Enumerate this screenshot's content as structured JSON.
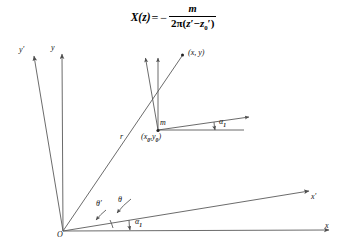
{
  "figure": {
    "equation": {
      "lhs": "X(z)",
      "equals": "=",
      "sign": "−",
      "numerator": "m",
      "denominator_prefix": "2π(",
      "denominator_z": "z",
      "denominator_prime": "′",
      "denominator_minus": "−",
      "denominator_z0": "z",
      "denominator_z0_sub": "0",
      "denominator_z0_prime": "′",
      "denominator_suffix": ")",
      "plain": "X(z) = − m / (2π(z′ − z′0))"
    },
    "labels": {
      "origin": "O",
      "axis_y_prime": "y′",
      "axis_y": "y",
      "axis_x_prime": "x′",
      "axis_x": "x",
      "point_xy": "(x, y)",
      "source_m": "m",
      "source_coords": "(x0,y0)",
      "source_coords_parts": {
        "open": "(",
        "x": "x",
        "xsub": "0",
        "comma": ",",
        "y": "y",
        "ysub": "0",
        "close": ")"
      },
      "radius": "r",
      "angle_theta": "θ",
      "angle_theta_prime": "θ′",
      "angle_alpha1_origin": "α1",
      "angle_alpha1_source": "α1",
      "alpha_base": "α",
      "alpha_sub": "1"
    },
    "colors": {
      "background": "#ffffff",
      "stroke": "#5a5a5a",
      "text": "#111111",
      "marker": "#222222"
    },
    "geometry": {
      "origin": [
        63,
        231
      ],
      "point_xy": [
        184,
        54
      ],
      "source_m": [
        158,
        130
      ],
      "y_axis_tip": [
        62,
        50
      ],
      "y_prime_axis_tip": [
        33,
        52
      ],
      "x_axis_tip": [
        333,
        230
      ],
      "x_prime_axis_tip": [
        313,
        190
      ],
      "m_y_axis_tip": [
        158,
        56
      ],
      "m_y_prime_axis_tip": [
        145,
        55
      ],
      "m_x_prime_tip": [
        253,
        116
      ],
      "m_x_tip": [
        248,
        133
      ],
      "rotation_alpha1_deg": 7.6
    }
  }
}
